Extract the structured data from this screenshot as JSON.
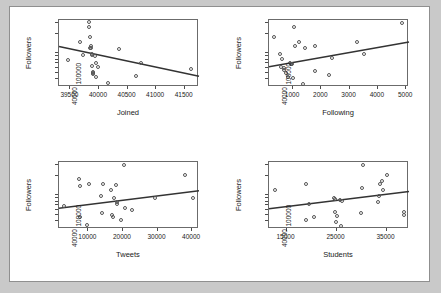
{
  "figure": {
    "background": "#c9c9c9",
    "panel_background": "#ffffff",
    "frame_color": "#6b6b6b",
    "point_color": "#555555",
    "line_color": "#333333",
    "layout": "2x2 grid of scatterplots"
  },
  "chart_data": [
    {
      "type": "scatter",
      "title": "",
      "xlabel": "Joined",
      "ylabel": "Followers",
      "grid": false,
      "legend": "none",
      "yscale": "log",
      "xlim": [
        39300,
        41750
      ],
      "ylim": [
        30000,
        330000
      ],
      "xticks": [
        39500,
        40000,
        40500,
        41000,
        41500
      ],
      "xticklabels": [
        "39500",
        "40000",
        "40500",
        "41000",
        "41500"
      ],
      "yticks": [
        40000,
        100000
      ],
      "yticklabels": [
        "40000",
        "100000"
      ],
      "points": [
        {
          "x": 39470,
          "y": 78000
        },
        {
          "x": 39680,
          "y": 150000
        },
        {
          "x": 39720,
          "y": 92000
        },
        {
          "x": 39830,
          "y": 250000
        },
        {
          "x": 39840,
          "y": 300000
        },
        {
          "x": 39850,
          "y": 175000
        },
        {
          "x": 39855,
          "y": 120000
        },
        {
          "x": 39860,
          "y": 118000
        },
        {
          "x": 39870,
          "y": 130000
        },
        {
          "x": 39880,
          "y": 95000
        },
        {
          "x": 39885,
          "y": 92000
        },
        {
          "x": 39890,
          "y": 62000
        },
        {
          "x": 39895,
          "y": 50000
        },
        {
          "x": 39900,
          "y": 48000
        },
        {
          "x": 39910,
          "y": 47000
        },
        {
          "x": 39930,
          "y": 90000
        },
        {
          "x": 39950,
          "y": 70000
        },
        {
          "x": 39960,
          "y": 42000
        },
        {
          "x": 39990,
          "y": 60000
        },
        {
          "x": 40170,
          "y": 34000
        },
        {
          "x": 40350,
          "y": 115000
        },
        {
          "x": 40660,
          "y": 44000
        },
        {
          "x": 40740,
          "y": 70000
        },
        {
          "x": 41620,
          "y": 57000
        }
      ],
      "fit": {
        "x0": 39300,
        "y0": 128000,
        "x1": 41750,
        "y1": 44000,
        "slope": "negative"
      }
    },
    {
      "type": "scatter",
      "title": "",
      "xlabel": "Following",
      "ylabel": "Followers",
      "grid": false,
      "legend": "none",
      "yscale": "log",
      "xlim": [
        150,
        5100
      ],
      "ylim": [
        30000,
        330000
      ],
      "xticks": [
        1000,
        2000,
        3000,
        4000,
        5000
      ],
      "xticklabels": [
        "1000",
        "2000",
        "3000",
        "4000",
        "5000"
      ],
      "yticks": [
        40000,
        100000
      ],
      "yticklabels": [
        "40000",
        "100000"
      ],
      "points": [
        {
          "x": 330,
          "y": 175000
        },
        {
          "x": 560,
          "y": 95000
        },
        {
          "x": 600,
          "y": 60000
        },
        {
          "x": 640,
          "y": 80000
        },
        {
          "x": 690,
          "y": 58000
        },
        {
          "x": 700,
          "y": 55000
        },
        {
          "x": 760,
          "y": 48000
        },
        {
          "x": 840,
          "y": 42000
        },
        {
          "x": 900,
          "y": 70000
        },
        {
          "x": 930,
          "y": 68000
        },
        {
          "x": 950,
          "y": 66000
        },
        {
          "x": 980,
          "y": 66000
        },
        {
          "x": 1000,
          "y": 40000
        },
        {
          "x": 1060,
          "y": 250000
        },
        {
          "x": 1100,
          "y": 130000
        },
        {
          "x": 1240,
          "y": 150000
        },
        {
          "x": 1380,
          "y": 33000
        },
        {
          "x": 1430,
          "y": 118000
        },
        {
          "x": 1780,
          "y": 130000
        },
        {
          "x": 1800,
          "y": 52000
        },
        {
          "x": 2300,
          "y": 45000
        },
        {
          "x": 2380,
          "y": 83000
        },
        {
          "x": 3280,
          "y": 145000
        },
        {
          "x": 3520,
          "y": 95000
        },
        {
          "x": 4870,
          "y": 290000
        }
      ],
      "fit": {
        "x0": 150,
        "y0": 62000,
        "x1": 5100,
        "y1": 150000,
        "slope": "positive"
      }
    },
    {
      "type": "scatter",
      "title": "",
      "xlabel": "Tweets",
      "ylabel": "Followers",
      "grid": false,
      "legend": "none",
      "yscale": "log",
      "xlim": [
        1500,
        42000
      ],
      "ylim": [
        30000,
        330000
      ],
      "xticks": [
        10000,
        20000,
        30000,
        40000
      ],
      "xticklabels": [
        "10000",
        "20000",
        "30000",
        "40000"
      ],
      "yticks": [
        40000,
        100000
      ],
      "yticklabels": [
        "40000",
        "100000"
      ],
      "points": [
        {
          "x": 3200,
          "y": 68000
        },
        {
          "x": 7400,
          "y": 175000
        },
        {
          "x": 7600,
          "y": 135000
        },
        {
          "x": 7700,
          "y": 46000
        },
        {
          "x": 9700,
          "y": 34000
        },
        {
          "x": 10400,
          "y": 150000
        },
        {
          "x": 13900,
          "y": 95000
        },
        {
          "x": 14100,
          "y": 52000
        },
        {
          "x": 14300,
          "y": 150000
        },
        {
          "x": 16700,
          "y": 120000
        },
        {
          "x": 17000,
          "y": 48000
        },
        {
          "x": 17200,
          "y": 46000
        },
        {
          "x": 17600,
          "y": 90000
        },
        {
          "x": 18100,
          "y": 140000
        },
        {
          "x": 18300,
          "y": 78000
        },
        {
          "x": 18500,
          "y": 73000
        },
        {
          "x": 19700,
          "y": 41000
        },
        {
          "x": 20400,
          "y": 290000
        },
        {
          "x": 20700,
          "y": 63000
        },
        {
          "x": 22800,
          "y": 58000
        },
        {
          "x": 29400,
          "y": 88000
        },
        {
          "x": 38000,
          "y": 200000
        },
        {
          "x": 40500,
          "y": 90000
        }
      ],
      "fit": {
        "x0": 1500,
        "y0": 63000,
        "x1": 42000,
        "y1": 118000,
        "slope": "positive"
      }
    },
    {
      "type": "scatter",
      "title": "",
      "xlabel": "Students",
      "ylabel": "Followers",
      "grid": false,
      "legend": "none",
      "yscale": "log",
      "xlim": [
        11500,
        39500
      ],
      "ylim": [
        30000,
        330000
      ],
      "xticks": [
        15000,
        25000,
        35000
      ],
      "xticklabels": [
        "15000",
        "25000",
        "35000"
      ],
      "yticks": [
        40000,
        100000
      ],
      "yticklabels": [
        "40000",
        "100000"
      ],
      "points": [
        {
          "x": 12800,
          "y": 120000
        },
        {
          "x": 18900,
          "y": 150000
        },
        {
          "x": 19000,
          "y": 41000
        },
        {
          "x": 19500,
          "y": 72000
        },
        {
          "x": 20600,
          "y": 45000
        },
        {
          "x": 24500,
          "y": 90000
        },
        {
          "x": 24700,
          "y": 55000
        },
        {
          "x": 24800,
          "y": 85000
        },
        {
          "x": 24900,
          "y": 38000
        },
        {
          "x": 25100,
          "y": 47000
        },
        {
          "x": 25800,
          "y": 82000
        },
        {
          "x": 26000,
          "y": 33000
        },
        {
          "x": 26100,
          "y": 80000
        },
        {
          "x": 29900,
          "y": 52000
        },
        {
          "x": 30100,
          "y": 130000
        },
        {
          "x": 30400,
          "y": 290000
        },
        {
          "x": 33300,
          "y": 78000
        },
        {
          "x": 33500,
          "y": 95000
        },
        {
          "x": 33700,
          "y": 150000
        },
        {
          "x": 34200,
          "y": 165000
        },
        {
          "x": 34400,
          "y": 120000
        },
        {
          "x": 35200,
          "y": 200000
        },
        {
          "x": 38500,
          "y": 55000
        },
        {
          "x": 38600,
          "y": 48000
        }
      ],
      "fit": {
        "x0": 11500,
        "y0": 62000,
        "x1": 39500,
        "y1": 115000,
        "slope": "positive"
      }
    }
  ]
}
